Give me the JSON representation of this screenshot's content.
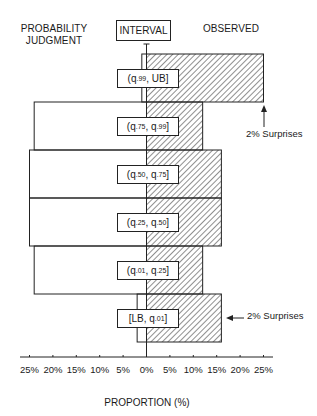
{
  "chart_data": {
    "type": "bar",
    "title": "",
    "layout": "back-to-back horizontal bars",
    "headers": {
      "left": "PROBABILITY JUDGMENT",
      "center": "INTERVAL",
      "right": "OBSERVED"
    },
    "categories": [
      "(q.99, UB]",
      "(q.75, q.99]",
      "(q.50, q.75]",
      "(q.25, q.50]",
      "(q.01, q.25]",
      "[LB, q.01]"
    ],
    "category_parts": [
      {
        "open": "(q",
        "sub1": ".99",
        "mid": ", UB]",
        "sub2": "",
        "close": ""
      },
      {
        "open": "(q",
        "sub1": ".75",
        "mid": ", q",
        "sub2": ".99",
        "close": "]"
      },
      {
        "open": "(q",
        "sub1": ".50",
        "mid": ", q",
        "sub2": ".75",
        "close": "]"
      },
      {
        "open": "(q",
        "sub1": ".25",
        "mid": ", q",
        "sub2": ".50",
        "close": "]"
      },
      {
        "open": "(q",
        "sub1": ".01",
        "mid": ", q",
        "sub2": ".25",
        "close": "]"
      },
      {
        "open": "[LB, q",
        "sub1": ".01",
        "mid": "]",
        "sub2": "",
        "close": ""
      }
    ],
    "series": [
      {
        "name": "Probability Judgment",
        "side": "left",
        "fill": "none",
        "values": [
          1,
          24,
          25,
          25,
          24,
          2
        ]
      },
      {
        "name": "Observed",
        "side": "right",
        "fill": "hatched",
        "values": [
          25,
          12,
          16,
          16,
          12,
          16
        ]
      }
    ],
    "xlabel": "PROPORTION (%)",
    "ylabel": "",
    "xlim": [
      -25,
      25
    ],
    "x_ticks": [
      "25%",
      "20%",
      "15%",
      "10%",
      "5%",
      "0%",
      "5%",
      "10%",
      "15%",
      "20%",
      "25%"
    ],
    "grid": false,
    "annotations": [
      {
        "text": "2% Surprises",
        "target": "(q.99, UB]",
        "arrow": "up"
      },
      {
        "text": "2% Surprises",
        "target": "[LB, q.01]",
        "arrow": "left"
      }
    ]
  },
  "colors": {
    "line": "#222222",
    "hatch": "#333333",
    "background": "#ffffff"
  }
}
